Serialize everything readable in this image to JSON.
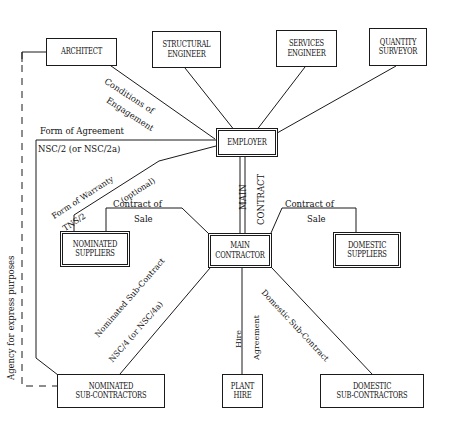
{
  "diagram": {
    "nodes": [
      {
        "id": "architect",
        "label": "ARCHITECT"
      },
      {
        "id": "structural_engineer",
        "label": "STRUCTURAL\nENGINEER"
      },
      {
        "id": "services_engineer",
        "label": "SERVICES\nENGINEER"
      },
      {
        "id": "quantity_surveyor",
        "label": "QUANTITY\nSURVEYOR"
      },
      {
        "id": "employer",
        "label": "EMPLOYER"
      },
      {
        "id": "nominated_suppliers",
        "label": "NOMINATED\nSUPPLIERS"
      },
      {
        "id": "main_contractor",
        "label": "MAIN\nCONTRACTOR"
      },
      {
        "id": "domestic_suppliers",
        "label": "DOMESTIC\nSUPPLIERS"
      },
      {
        "id": "nominated_sub_contractors",
        "label": "NOMINATED\nSUB-CONTRACTORS"
      },
      {
        "id": "plant_hire",
        "label": "PLANT\nHIRE"
      },
      {
        "id": "domestic_sub_contractors",
        "label": "DOMESTIC\nSUB-CONTRACTORS"
      }
    ],
    "edge_labels": [
      {
        "id": "conditions_of_engagement",
        "line1": "Conditions of",
        "line2": "Engagement"
      },
      {
        "id": "form_of_agreement",
        "text": "Form of Agreement"
      },
      {
        "id": "nsc2",
        "text": "NSC/2 (or NSC/2a)"
      },
      {
        "id": "form_of_warranty",
        "text": "Form of Warranty"
      },
      {
        "id": "tns2",
        "text": "TNS/2"
      },
      {
        "id": "optional",
        "text": "(optional)"
      },
      {
        "id": "main",
        "text": "MAIN"
      },
      {
        "id": "contract",
        "text": "CONTRACT"
      },
      {
        "id": "contract_of_sale_left_1",
        "text": "Contract  of"
      },
      {
        "id": "contract_of_sale_left_2",
        "text": "Sale"
      },
      {
        "id": "contract_of_sale_right_1",
        "text": "Contract  of"
      },
      {
        "id": "contract_of_sale_right_2",
        "text": "Sale"
      },
      {
        "id": "nominated_sub_contract",
        "text": "Nominated Sub-Contract"
      },
      {
        "id": "nsc4",
        "text": "NSC/4 (or NSC/4a)"
      },
      {
        "id": "domestic_sub_contract",
        "text": "Domestic Sub-Contract"
      },
      {
        "id": "hire",
        "text": "Hire"
      },
      {
        "id": "agreement",
        "text": "Agreement"
      },
      {
        "id": "agency_for_express_purposes",
        "text": "Agency for express purposes"
      }
    ],
    "colors": {
      "line": "#1a1a1a",
      "text": "#111111",
      "background": "#ffffff"
    }
  }
}
